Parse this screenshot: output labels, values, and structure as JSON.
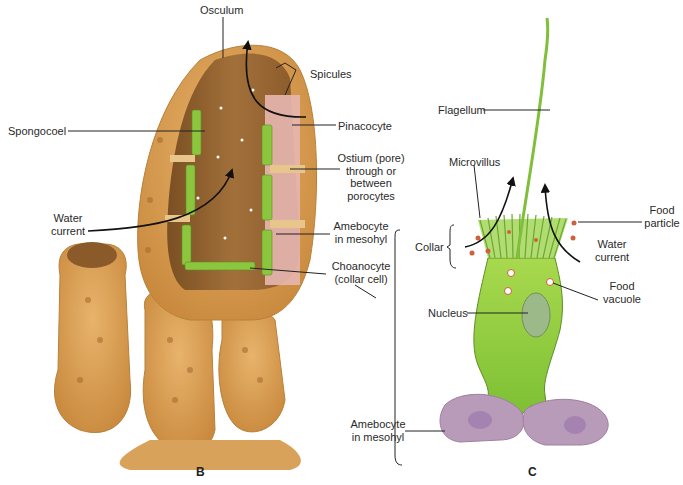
{
  "figure": {
    "panel_b": {
      "letter": "B",
      "subject": "sponge-cutaway",
      "labels": {
        "osculum": "Osculum",
        "spicules": "Spicules",
        "spongocoel": "Spongocoel",
        "pinacocyte": "Pinacocyte",
        "ostium_1": "Ostium (pore)",
        "ostium_2": "through or",
        "ostium_3": "between",
        "ostium_4": "porocytes",
        "water_current_1": "Water",
        "water_current_2": "current",
        "amebocyte_1": "Amebocyte",
        "amebocyte_2": "in mesohyl",
        "choanocyte_1": "Choanocyte",
        "choanocyte_2": "(collar cell)"
      }
    },
    "panel_c": {
      "letter": "C",
      "subject": "choanocyte-detail",
      "labels": {
        "flagellum": "Flagellum",
        "microvillus": "Microvillus",
        "collar": "Collar",
        "food_particle_1": "Food",
        "food_particle_2": "particle",
        "water_current_1": "Water",
        "water_current_2": "current",
        "food_vacuole_1": "Food",
        "food_vacuole_2": "vacuole",
        "nucleus": "Nucleus",
        "amebocyte_1": "Amebocyte",
        "amebocyte_2": "in mesohyl"
      }
    },
    "colors": {
      "sponge_body": "#d9a25a",
      "sponge_interior": "#9c6a33",
      "choanocyte_green": "#8cc63f",
      "amebocyte_purple": "#b89bb8",
      "food_particle": "#d0603a"
    }
  }
}
